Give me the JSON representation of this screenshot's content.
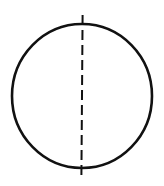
{
  "diagram": {
    "colors": {
      "background": "#ffffff",
      "stroke": "#111111"
    },
    "circle": {
      "cx": 82,
      "cy": 96,
      "rx": 70,
      "ry": 72,
      "stroke_width": 2.6
    },
    "axis_line": {
      "x1": 82.6,
      "y1": 15,
      "x2": 81.4,
      "y2": 176,
      "stroke_width": 2,
      "style": "dashed",
      "dash_pattern": "10 5",
      "extends_beyond_circle": true
    }
  }
}
